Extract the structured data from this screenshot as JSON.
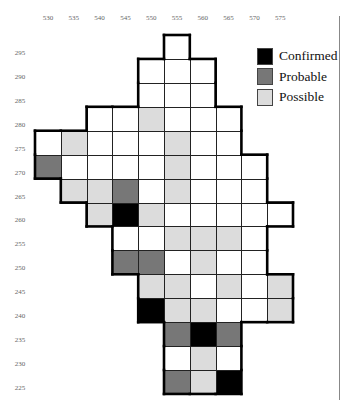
{
  "chart_data": {
    "type": "heatmap",
    "title": "",
    "xlabel": "",
    "ylabel": "",
    "x_ticks": [
      530,
      535,
      540,
      545,
      550,
      555,
      560,
      565,
      570,
      575
    ],
    "y_ticks": [
      295,
      290,
      285,
      280,
      275,
      270,
      265,
      260,
      255,
      250,
      245,
      240,
      235,
      230,
      225
    ],
    "legend": [
      {
        "key": "confirmed",
        "label": "Confirmed",
        "color": "#000000"
      },
      {
        "key": "probable",
        "label": "Probable",
        "color": "#777777"
      },
      {
        "key": "possible",
        "label": "Possible",
        "color": "#dcdcdc"
      }
    ],
    "empty_color": "#ffffff",
    "rows": [
      {
        "y": 295,
        "cells": [
          {
            "x": 555,
            "s": "none"
          }
        ]
      },
      {
        "y": 290,
        "cells": [
          {
            "x": 550,
            "s": "none"
          },
          {
            "x": 555,
            "s": "none"
          },
          {
            "x": 560,
            "s": "none"
          }
        ]
      },
      {
        "y": 285,
        "cells": [
          {
            "x": 550,
            "s": "none"
          },
          {
            "x": 555,
            "s": "none"
          },
          {
            "x": 560,
            "s": "none"
          }
        ]
      },
      {
        "y": 280,
        "cells": [
          {
            "x": 540,
            "s": "none"
          },
          {
            "x": 545,
            "s": "none"
          },
          {
            "x": 550,
            "s": "possible"
          },
          {
            "x": 555,
            "s": "none"
          },
          {
            "x": 560,
            "s": "none"
          },
          {
            "x": 565,
            "s": "none"
          }
        ]
      },
      {
        "y": 275,
        "cells": [
          {
            "x": 530,
            "s": "none"
          },
          {
            "x": 535,
            "s": "possible"
          },
          {
            "x": 540,
            "s": "none"
          },
          {
            "x": 545,
            "s": "none"
          },
          {
            "x": 550,
            "s": "none"
          },
          {
            "x": 555,
            "s": "possible"
          },
          {
            "x": 560,
            "s": "none"
          },
          {
            "x": 565,
            "s": "none"
          }
        ]
      },
      {
        "y": 270,
        "cells": [
          {
            "x": 530,
            "s": "probable"
          },
          {
            "x": 535,
            "s": "none"
          },
          {
            "x": 540,
            "s": "none"
          },
          {
            "x": 545,
            "s": "none"
          },
          {
            "x": 550,
            "s": "none"
          },
          {
            "x": 555,
            "s": "possible"
          },
          {
            "x": 560,
            "s": "none"
          },
          {
            "x": 565,
            "s": "none"
          },
          {
            "x": 570,
            "s": "none"
          }
        ]
      },
      {
        "y": 265,
        "cells": [
          {
            "x": 535,
            "s": "possible"
          },
          {
            "x": 540,
            "s": "possible"
          },
          {
            "x": 545,
            "s": "probable"
          },
          {
            "x": 550,
            "s": "none"
          },
          {
            "x": 555,
            "s": "possible"
          },
          {
            "x": 560,
            "s": "none"
          },
          {
            "x": 565,
            "s": "none"
          },
          {
            "x": 570,
            "s": "none"
          }
        ]
      },
      {
        "y": 260,
        "cells": [
          {
            "x": 540,
            "s": "possible"
          },
          {
            "x": 545,
            "s": "confirmed"
          },
          {
            "x": 550,
            "s": "possible"
          },
          {
            "x": 555,
            "s": "none"
          },
          {
            "x": 560,
            "s": "none"
          },
          {
            "x": 565,
            "s": "none"
          },
          {
            "x": 570,
            "s": "none"
          },
          {
            "x": 575,
            "s": "none"
          }
        ]
      },
      {
        "y": 255,
        "cells": [
          {
            "x": 545,
            "s": "none"
          },
          {
            "x": 550,
            "s": "none"
          },
          {
            "x": 555,
            "s": "possible"
          },
          {
            "x": 560,
            "s": "possible"
          },
          {
            "x": 565,
            "s": "possible"
          },
          {
            "x": 570,
            "s": "none"
          }
        ]
      },
      {
        "y": 250,
        "cells": [
          {
            "x": 545,
            "s": "probable"
          },
          {
            "x": 550,
            "s": "probable"
          },
          {
            "x": 555,
            "s": "none"
          },
          {
            "x": 560,
            "s": "possible"
          },
          {
            "x": 565,
            "s": "none"
          },
          {
            "x": 570,
            "s": "none"
          }
        ]
      },
      {
        "y": 245,
        "cells": [
          {
            "x": 550,
            "s": "possible"
          },
          {
            "x": 555,
            "s": "possible"
          },
          {
            "x": 560,
            "s": "none"
          },
          {
            "x": 565,
            "s": "possible"
          },
          {
            "x": 570,
            "s": "none"
          },
          {
            "x": 575,
            "s": "possible"
          }
        ]
      },
      {
        "y": 240,
        "cells": [
          {
            "x": 550,
            "s": "confirmed"
          },
          {
            "x": 555,
            "s": "possible"
          },
          {
            "x": 560,
            "s": "possible"
          },
          {
            "x": 565,
            "s": "none"
          },
          {
            "x": 570,
            "s": "none"
          },
          {
            "x": 575,
            "s": "possible"
          }
        ]
      },
      {
        "y": 235,
        "cells": [
          {
            "x": 555,
            "s": "probable"
          },
          {
            "x": 560,
            "s": "confirmed"
          },
          {
            "x": 565,
            "s": "probable"
          }
        ]
      },
      {
        "y": 230,
        "cells": [
          {
            "x": 555,
            "s": "none"
          },
          {
            "x": 560,
            "s": "possible"
          },
          {
            "x": 565,
            "s": "none"
          }
        ]
      },
      {
        "y": 225,
        "cells": [
          {
            "x": 555,
            "s": "probable"
          },
          {
            "x": 560,
            "s": "possible"
          },
          {
            "x": 565,
            "s": "confirmed"
          }
        ]
      }
    ],
    "grid": true,
    "legend_position": "top-right"
  },
  "legend": {
    "confirmed": "Confirmed",
    "probable": "Probable",
    "possible": "Possible"
  }
}
